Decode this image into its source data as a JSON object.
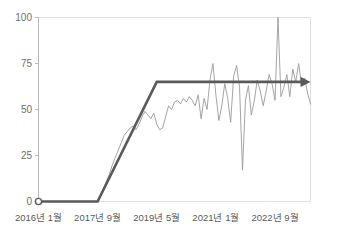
{
  "chart_data": {
    "type": "line",
    "title": "",
    "subtitle": "",
    "xlabel": "",
    "ylabel": "",
    "ylim": [
      0,
      100
    ],
    "yticks": [
      0,
      25,
      50,
      75,
      100
    ],
    "ytick_labels": [
      "0",
      "25",
      "50",
      "75",
      "100"
    ],
    "xtick_labels": [
      "2016년 1월",
      "2017년 9월",
      "2019년 5월",
      "2021년 1월",
      "2022년 9월"
    ],
    "xtick_values": [
      0,
      20,
      40,
      60,
      80
    ],
    "xlim": [
      0,
      92
    ],
    "grid": false,
    "legend": false,
    "legend_position": "none",
    "colors": {
      "trend_line": "#5a5a5a",
      "data_line": "#9a9a9a",
      "axis": "#b8b8b8",
      "tick_text": "#6e6e6e",
      "plot_border": "#e0e0e0",
      "background": "#ffffff"
    },
    "annotations": {
      "start_marker": {
        "shape": "open-circle",
        "x": 0,
        "y": 0
      },
      "end_marker": {
        "shape": "arrowhead",
        "x": 92,
        "y": 65
      }
    },
    "series": [
      {
        "name": "trend",
        "style": "thick-line-with-arrow",
        "color": "#5a5a5a",
        "x": [
          0,
          20,
          40,
          92
        ],
        "values": [
          0,
          0,
          65,
          65
        ]
      },
      {
        "name": "observed",
        "style": "thin-noisy-line",
        "color": "#9a9a9a",
        "x": [
          20,
          21,
          22,
          23,
          24,
          25,
          26,
          27,
          28,
          29,
          30,
          31,
          32,
          33,
          34,
          35,
          36,
          37,
          38,
          39,
          40,
          41,
          42,
          43,
          44,
          45,
          46,
          47,
          48,
          49,
          50,
          51,
          52,
          53,
          54,
          55,
          56,
          57,
          58,
          59,
          60,
          61,
          62,
          63,
          64,
          65,
          66,
          67,
          68,
          69,
          70,
          71,
          72,
          73,
          74,
          75,
          76,
          77,
          78,
          79,
          80,
          81,
          82,
          83,
          84,
          85,
          86,
          87,
          88,
          89,
          90,
          91,
          92
        ],
        "values": [
          0,
          3,
          7,
          11,
          15,
          20,
          24,
          28,
          32,
          36,
          38,
          40,
          41,
          39,
          42,
          46,
          49,
          47,
          45,
          48,
          42,
          39,
          40,
          46,
          52,
          50,
          54,
          55,
          53,
          56,
          54,
          57,
          55,
          52,
          58,
          45,
          56,
          50,
          66,
          75,
          58,
          44,
          52,
          64,
          56,
          43,
          68,
          74,
          62,
          17,
          55,
          63,
          47,
          55,
          66,
          60,
          52,
          60,
          69,
          64,
          55,
          100,
          57,
          62,
          69,
          57,
          72,
          65,
          75,
          63,
          67,
          59,
          53
        ]
      }
    ]
  }
}
